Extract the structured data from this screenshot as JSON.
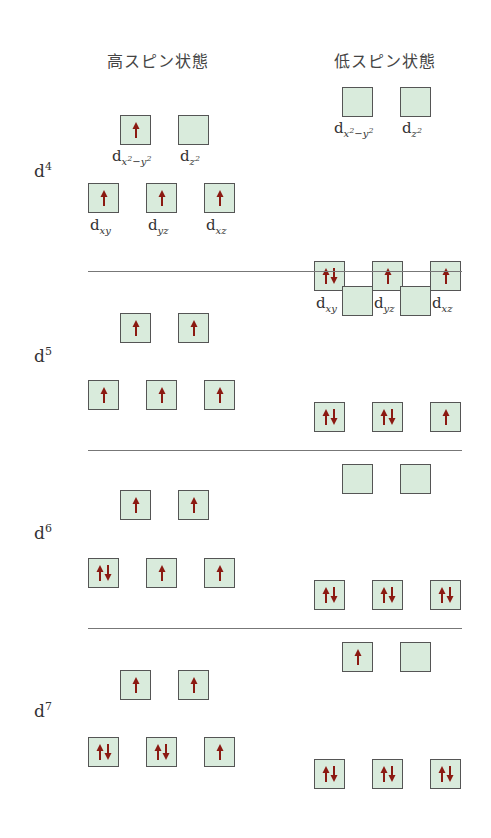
{
  "headers": {
    "high_spin": "高スピン状態",
    "low_spin": "低スピン状態"
  },
  "colors": {
    "box_fill": "#d9ebdc",
    "box_border": "#555555",
    "arrow": "#8b1a12"
  },
  "orbital_labels": {
    "eg": [
      "x²−y²",
      "z²"
    ],
    "t2g": [
      "xy",
      "yz",
      "xz"
    ]
  },
  "configs": [
    {
      "label": "d",
      "n": "4",
      "high": {
        "eg": [
          "up",
          "empty"
        ],
        "t2g": [
          "up",
          "up",
          "up"
        ]
      },
      "low": {
        "eg": [
          "empty",
          "empty"
        ],
        "t2g": [
          "pair",
          "up",
          "up"
        ]
      }
    },
    {
      "label": "d",
      "n": "5",
      "high": {
        "eg": [
          "up",
          "up"
        ],
        "t2g": [
          "up",
          "up",
          "up"
        ]
      },
      "low": {
        "eg": [
          "empty",
          "empty"
        ],
        "t2g": [
          "pair",
          "pair",
          "up"
        ]
      }
    },
    {
      "label": "d",
      "n": "6",
      "high": {
        "eg": [
          "up",
          "up"
        ],
        "t2g": [
          "pair",
          "up",
          "up"
        ]
      },
      "low": {
        "eg": [
          "empty",
          "empty"
        ],
        "t2g": [
          "pair",
          "pair",
          "pair"
        ]
      }
    },
    {
      "label": "d",
      "n": "7",
      "high": {
        "eg": [
          "up",
          "up"
        ],
        "t2g": [
          "pair",
          "pair",
          "up"
        ]
      },
      "low": {
        "eg": [
          "up",
          "empty"
        ],
        "t2g": [
          "pair",
          "pair",
          "pair"
        ]
      }
    }
  ]
}
